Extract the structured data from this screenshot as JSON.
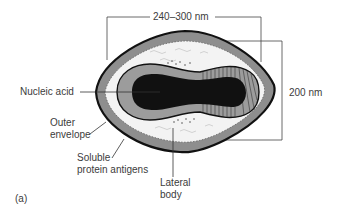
{
  "figure": {
    "panel_label": "(a)",
    "dimensions": {
      "width_label": "240–300 nm",
      "height_label": "200 nm"
    },
    "labels": {
      "nucleic_acid": "Nucleic acid",
      "outer_envelope_line1": "Outer",
      "outer_envelope_line2": "envelope",
      "soluble_line1": "Soluble",
      "soluble_line2": "protein antigens",
      "lateral_line1": "Lateral",
      "lateral_line2": "body"
    },
    "colors": {
      "outer_shell": "#8c8c8c",
      "outline": "#111111",
      "white_layer": "#f4f4f4",
      "core_wall": "#9a9a9a",
      "nucleic_acid": "#111111",
      "leader_lines": "#333333"
    }
  }
}
